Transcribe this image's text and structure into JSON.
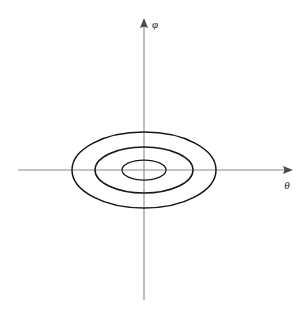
{
  "figure": {
    "background_color": "#ffffff",
    "width": 308,
    "height": 313
  },
  "axes": {
    "origin": {
      "x": 144,
      "y": 170
    },
    "horizontal": {
      "name": "theta-axis",
      "label": "θ",
      "label_x": 287,
      "label_y": 189,
      "x_start": 18,
      "x_end": 293,
      "y": 170,
      "arrow": "right",
      "color": "#8a8a8a"
    },
    "vertical": {
      "name": "phi-axis",
      "label": "φ",
      "label_x": 152,
      "label_y": 28,
      "y_start": 300,
      "y_end": 18,
      "x": 144,
      "arrow": "up",
      "color": "#8a8a8a"
    }
  },
  "chart_data": {
    "type": "line",
    "xlabel": "θ",
    "ylabel": "φ",
    "grid": false,
    "legend": null,
    "annotations": [],
    "xlim": [
      -130,
      150
    ],
    "ylim": [
      -132,
      152
    ],
    "series": [
      {
        "name": "orbit-outer",
        "shape": "ellipse",
        "center": [
          0,
          0
        ],
        "semi_axis_x": 72,
        "semi_axis_y": 38,
        "x_intercepts": [
          -72,
          72
        ],
        "y_intercepts": [
          -38,
          38
        ],
        "stroke": "#171717"
      },
      {
        "name": "orbit-middle",
        "shape": "ellipse",
        "center": [
          0,
          0
        ],
        "semi_axis_x": 49,
        "semi_axis_y": 23,
        "x_intercepts": [
          -49,
          49
        ],
        "y_intercepts": [
          -23,
          23
        ],
        "stroke": "#171717"
      },
      {
        "name": "orbit-inner",
        "shape": "ellipse",
        "center": [
          0,
          0
        ],
        "semi_axis_x": 22,
        "semi_axis_y": 10,
        "x_intercepts": [
          -22,
          22
        ],
        "y_intercepts": [
          -10,
          10
        ],
        "stroke": "#171717"
      }
    ]
  }
}
